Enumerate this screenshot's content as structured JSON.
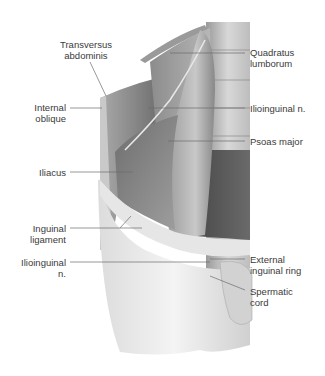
{
  "figure": {
    "type": "anatomical illustration",
    "accent_colors": {
      "leader_line": "#6b6b6b",
      "text": "#3a3a3a",
      "muscle_dark": "#4a4a4a",
      "muscle_mid": "#8a8a8a",
      "fascia_light": "#e8e8e8"
    }
  },
  "labels": {
    "transversus_abdominis": "Transversus\nabdominis",
    "internal_oblique": "Internal\noblique",
    "iliacus": "Iliacus",
    "inguinal_ligament": "Inguinal\nligament",
    "ilioinguinal_left": "Ilioinguinal\nn.",
    "quadratus_lumborum": "Quadratus\nlumborum",
    "ilioinguinal_right": "Ilioinguinal n.",
    "psoas_major": "Psoas major",
    "external_inguinal_ring": "External\ninguinal ring",
    "spermatic_cord": "Spermatic\ncord"
  }
}
